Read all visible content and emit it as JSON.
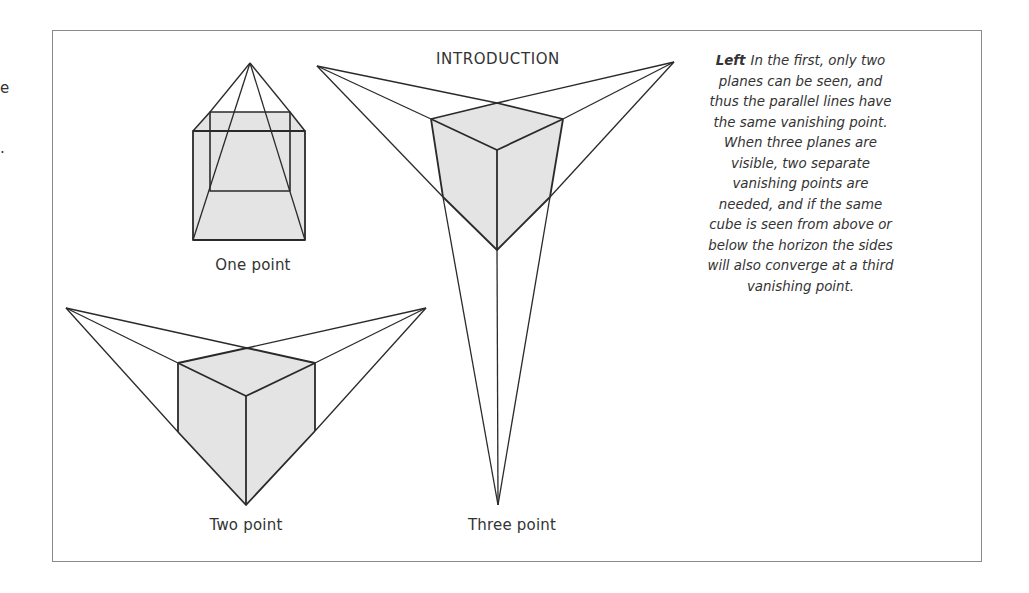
{
  "page": {
    "heading": "INTRODUCTION",
    "left_margin_fragments": [
      "e",
      "."
    ]
  },
  "figures": [
    {
      "id": "one_point",
      "label": "One point"
    },
    {
      "id": "two_point",
      "label": "Two point"
    },
    {
      "id": "three_point",
      "label": "Three point"
    }
  ],
  "caption": {
    "lead": "Left",
    "lines": [
      "In the first, only two",
      "planes can be seen, and",
      "thus the parallel lines have",
      "the same vanishing point.",
      "When three planes are",
      "visible, two separate",
      "vanishing points are",
      "needed, and if the same",
      "cube is seen from above or",
      "below the horizon the sides",
      "will also converge at a third",
      "vanishing point."
    ]
  },
  "colors": {
    "line": "#2a2a2a",
    "fill": "#e4e4e4",
    "frame": "#8a8a8a"
  }
}
